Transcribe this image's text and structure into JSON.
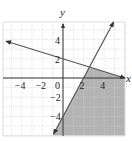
{
  "chart_data": {
    "type": "line",
    "title": "",
    "xlabel": "x",
    "ylabel": "y",
    "xlim": [
      -5.7,
      6
    ],
    "ylim": [
      -6,
      6
    ],
    "grid": true,
    "x_ticks": [
      -4,
      -2,
      0,
      2,
      4
    ],
    "y_ticks": [
      4,
      2,
      -2,
      -4
    ],
    "tick_labels": {
      "x": [
        "−4",
        "−2",
        "0",
        "2",
        "4"
      ],
      "y": [
        "4",
        "2",
        "−2",
        "−4"
      ]
    },
    "series": [
      {
        "name": "x + 3y = 6",
        "equation": "y = -x/3 + 2",
        "points": [
          [
            -5.5,
            3.83
          ],
          [
            0,
            2
          ],
          [
            6,
            0
          ]
        ],
        "arrows": "both",
        "color": "#555555"
      },
      {
        "name": "2x - y = 4",
        "equation": "y = 2x - 4",
        "points": [
          [
            -0.9,
            -5.8
          ],
          [
            0,
            -4
          ],
          [
            2,
            0
          ],
          [
            4.9,
            5.8
          ]
        ],
        "arrows": "both",
        "color": "#555555"
      }
    ],
    "shaded_region": {
      "description": "Region below y = -x/3 + 2 and right of/below y = 2x - 4",
      "inequalities": [
        "y <= -x/3 + 2",
        "y <= 2x - 4"
      ],
      "vertices": [
        [
          2.57,
          1.14
        ],
        [
          6,
          0
        ],
        [
          6,
          -6
        ],
        [
          -1,
          -6
        ]
      ],
      "fill": "#b3b3b3"
    }
  },
  "labels": {
    "x_axis": "x",
    "y_axis": "y"
  },
  "colors": {
    "grid": "#d0d0d0",
    "axis": "#333333",
    "line": "#555555",
    "shade": "#b3b3b3"
  }
}
